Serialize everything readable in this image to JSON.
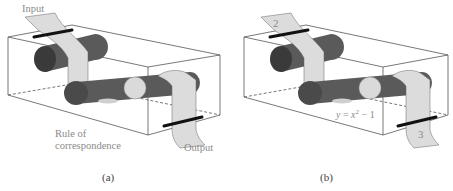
{
  "figure": {
    "panels": [
      {
        "id": "a",
        "caption": "(a)",
        "labels": {
          "input": "Input",
          "rule_line1": "Rule of",
          "rule_line2": "correspondence",
          "output": "Output"
        }
      },
      {
        "id": "b",
        "caption": "(b)",
        "input_value": "2",
        "rule_y": "y",
        "rule_eq": " = ",
        "rule_x": "x",
        "rule_exp": "2",
        "rule_tail": " − 1",
        "output_value": "3"
      }
    ],
    "colors": {
      "box_edge": "#444444",
      "roller_dark": "#3a3a3a",
      "roller_mid": "#5c5c5c",
      "roller_end_light": "#d9d9d9",
      "paper": "#dcdcdc",
      "clamp": "#111111",
      "label_text": "#8a8a8a"
    }
  }
}
